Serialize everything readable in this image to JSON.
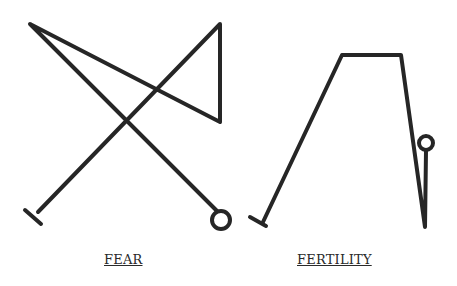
{
  "figures": [
    {
      "label": "FEAR",
      "stroke_color": "#262626",
      "path": "M220,214 L30,24 L220,122 L220,24 L38,212",
      "end_bar": {
        "x1": 25,
        "y1": 210,
        "x2": 41,
        "y2": 224
      },
      "end_circle": {
        "cx": 221,
        "cy": 220,
        "r": 9
      }
    },
    {
      "label": "FERTILITY",
      "stroke_color": "#262626",
      "path": "M263,222 L342,55 L401,55 L425,227 L426,151",
      "end_bar": {
        "x1": 250,
        "y1": 217,
        "x2": 266,
        "y2": 226
      },
      "end_circle": {
        "cx": 426,
        "cy": 143,
        "r": 7
      }
    }
  ]
}
